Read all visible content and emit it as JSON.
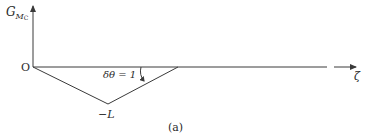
{
  "diagram": {
    "caption": "(a)",
    "y_axis_label": {
      "main": "G",
      "sub": "M",
      "subsub": "C"
    },
    "x_axis_label": "ζ",
    "origin_label": "O",
    "min_label": "−L",
    "angle_label": "δθ = 1",
    "colors": {
      "line": "#3a3a3a",
      "text": "#2a2a2a",
      "background": "#ffffff"
    },
    "geometry": {
      "origin": [
        33,
        67
      ],
      "y_axis_top": [
        33,
        4
      ],
      "x_axis_end": [
        358,
        67
      ],
      "triangle_bottom": [
        108,
        104
      ],
      "triangle_right": [
        178,
        67
      ]
    }
  }
}
